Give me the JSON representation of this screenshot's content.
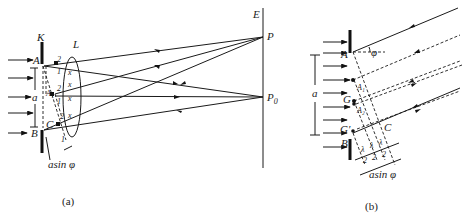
{
  "figure_a": {
    "caption": "(a)",
    "labels": {
      "slit": "K",
      "lens": "L",
      "screen": "E",
      "top_edge": "A",
      "bottom_edge": "B",
      "mid_point": "A₁",
      "foot_point": "C",
      "width": "a",
      "path_diff": "asin φ",
      "point_p": "P",
      "point_p0": "P",
      "point_p0_sub": "0",
      "ray_num_1": "1",
      "ray_num_2": "2"
    }
  },
  "figure_b": {
    "caption": "(b)",
    "labels": {
      "top_edge": "A",
      "bottom_edge": "B",
      "angle": "φ",
      "width": "a",
      "zone_a1": "A₁",
      "zone_a2": "A₂",
      "g": "G",
      "g_prime": "G′",
      "foot_point": "C",
      "half_lambda": "λ",
      "half_lambda_den": "2",
      "path_diff": "asin φ"
    }
  }
}
